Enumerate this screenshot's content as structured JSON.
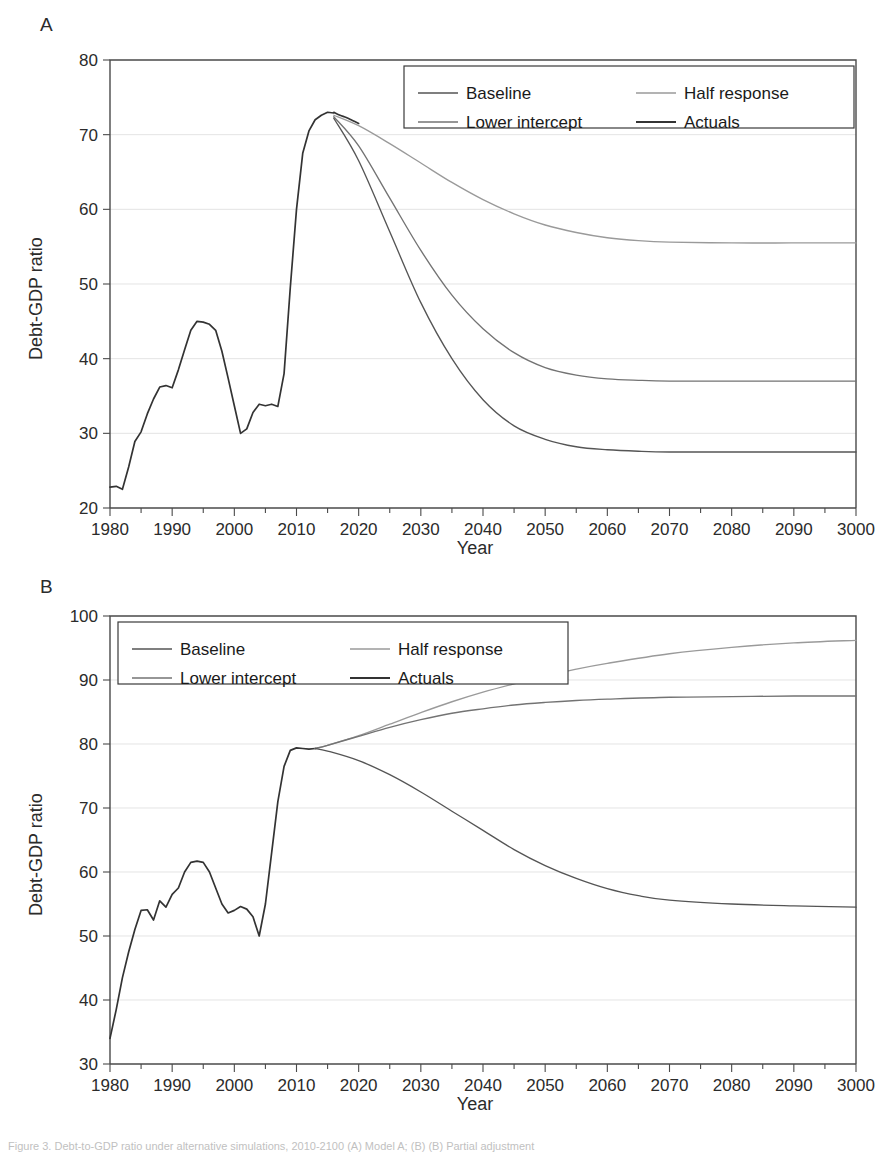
{
  "figure": {
    "caption": "Figure 3. Debt-to-GDP ratio under alternative simulations, 2010-2100 (A) Model A; (B) (B) Partial adjustment"
  },
  "panels": [
    {
      "letter": "A",
      "xlabel": "Year",
      "ylabel": "Debt-GDP ratio",
      "legend_position": "top-right"
    },
    {
      "letter": "B",
      "xlabel": "Year",
      "ylabel": "Debt-GDP ratio",
      "legend_position": "top-left"
    }
  ],
  "legend": {
    "entries": [
      "Baseline",
      "Half response",
      "Lower intercept",
      "Actuals"
    ]
  },
  "colors": {
    "baseline": "#555555",
    "half_response": "#9a9a9a",
    "lower_intercept": "#737373",
    "actuals": "#333333",
    "axis": "#4a4a4a",
    "grid": "#d8d8d8"
  },
  "chart_data": [
    {
      "type": "line",
      "panel": "A",
      "title": "",
      "xlabel": "Year",
      "ylabel": "Debt-GDP ratio",
      "xlim": [
        1980,
        2100
      ],
      "ylim": [
        20,
        80
      ],
      "yticks": [
        20,
        30,
        40,
        50,
        60,
        70,
        80
      ],
      "xticks": [
        1980,
        1990,
        2000,
        2010,
        2020,
        2030,
        2040,
        2050,
        2060,
        2070,
        2080,
        2090,
        3000
      ],
      "xtick_labels": [
        "1980",
        "1990",
        "2000",
        "2010",
        "2020",
        "2030",
        "2040",
        "2050",
        "2060",
        "2070",
        "2080",
        "2090",
        "3000"
      ],
      "minor_xtick_step": 5,
      "grid": "horizontal",
      "legend": [
        "Baseline",
        "Half response",
        "Lower intercept",
        "Actuals"
      ],
      "series": [
        {
          "name": "Historical",
          "color": "#333333",
          "x": [
            1980,
            1981,
            1982,
            1983,
            1984,
            1985,
            1986,
            1987,
            1988,
            1989,
            1990,
            1991,
            1992,
            1993,
            1994,
            1995,
            1996,
            1997,
            1998,
            1999,
            2000,
            2001,
            2002,
            2003,
            2004,
            2005,
            2006,
            2007,
            2008,
            2009,
            2010,
            2011,
            2012,
            2013,
            2014,
            2015,
            2016
          ],
          "values": [
            22.8,
            22.9,
            22.5,
            25.5,
            28.9,
            30.2,
            32.6,
            34.6,
            36.2,
            36.4,
            36.1,
            38.5,
            41.2,
            43.8,
            45.0,
            44.9,
            44.6,
            43.8,
            41.0,
            37.4,
            33.7,
            30.0,
            30.6,
            32.8,
            33.9,
            33.7,
            33.9,
            33.6,
            38.0,
            49.5,
            60.0,
            67.5,
            70.5,
            72.0,
            72.6,
            73.0,
            72.9
          ]
        },
        {
          "name": "Actuals",
          "color": "#333333",
          "x": [
            2016,
            2017,
            2018,
            2019,
            2020
          ],
          "values": [
            73.0,
            72.6,
            72.3,
            71.9,
            71.5
          ]
        },
        {
          "name": "Half response",
          "color": "#9a9a9a",
          "x": [
            2016,
            2020,
            2025,
            2030,
            2035,
            2040,
            2045,
            2050,
            2055,
            2060,
            2065,
            2070,
            2080,
            2090,
            2100
          ],
          "values": [
            72.6,
            71.2,
            68.8,
            66.2,
            63.6,
            61.3,
            59.4,
            57.9,
            56.9,
            56.2,
            55.8,
            55.6,
            55.5,
            55.5,
            55.5
          ]
        },
        {
          "name": "Lower intercept",
          "color": "#737373",
          "x": [
            2016,
            2020,
            2025,
            2030,
            2035,
            2040,
            2045,
            2050,
            2055,
            2060,
            2065,
            2070,
            2080,
            2090,
            2100
          ],
          "values": [
            72.4,
            68.5,
            61.5,
            54.5,
            48.5,
            44.0,
            40.8,
            38.8,
            37.8,
            37.3,
            37.1,
            37.0,
            37.0,
            37.0,
            37.0
          ]
        },
        {
          "name": "Baseline",
          "color": "#555555",
          "x": [
            2016,
            2020,
            2025,
            2030,
            2035,
            2040,
            2045,
            2050,
            2055,
            2060,
            2065,
            2070,
            2080,
            2090,
            2100
          ],
          "values": [
            72.2,
            66.5,
            57.0,
            47.5,
            40.0,
            34.5,
            31.0,
            29.2,
            28.2,
            27.8,
            27.6,
            27.5,
            27.5,
            27.5,
            27.5
          ]
        }
      ],
      "endpoints_2100": {
        "half_response": 55.5,
        "lower_intercept": 37.0,
        "baseline": 27.5
      },
      "peak": {
        "year": 2016,
        "value": 73.0
      }
    },
    {
      "type": "line",
      "panel": "B",
      "title": "",
      "xlabel": "Year",
      "ylabel": "Debt-GDP ratio",
      "xlim": [
        1980,
        2100
      ],
      "ylim": [
        30,
        100
      ],
      "yticks": [
        30,
        40,
        50,
        60,
        70,
        80,
        90,
        100
      ],
      "xticks": [
        1980,
        1990,
        2000,
        2010,
        2020,
        2030,
        2040,
        2050,
        2060,
        2070,
        2080,
        2090,
        3000
      ],
      "xtick_labels": [
        "1980",
        "1990",
        "2000",
        "2010",
        "2020",
        "2030",
        "2040",
        "2050",
        "2060",
        "2070",
        "2080",
        "2090",
        "3000"
      ],
      "minor_xtick_step": 5,
      "grid": "horizontal",
      "legend": [
        "Baseline",
        "Half response",
        "Lower intercept",
        "Actuals"
      ],
      "series": [
        {
          "name": "Historical",
          "color": "#333333",
          "x": [
            1980,
            1981,
            1982,
            1983,
            1984,
            1985,
            1986,
            1987,
            1988,
            1989,
            1990,
            1991,
            1992,
            1993,
            1994,
            1995,
            1996,
            1997,
            1998,
            1999,
            2000,
            2001,
            2002,
            2003,
            2004,
            2005,
            2006,
            2007,
            2008,
            2009,
            2010,
            2011,
            2012,
            2013
          ],
          "values": [
            34.0,
            38.5,
            43.5,
            47.5,
            51.0,
            54.0,
            54.1,
            52.5,
            55.5,
            54.5,
            56.5,
            57.5,
            60.0,
            61.5,
            61.7,
            61.5,
            60.0,
            57.5,
            55.0,
            53.6,
            54.0,
            54.6,
            54.2,
            53.0,
            50.0,
            55.0,
            63.0,
            71.0,
            76.5,
            79.0,
            79.4,
            79.3,
            79.2,
            79.3
          ]
        },
        {
          "name": "Half response",
          "color": "#9a9a9a",
          "x": [
            2013,
            2015,
            2020,
            2025,
            2030,
            2035,
            2040,
            2045,
            2050,
            2055,
            2060,
            2070,
            2080,
            2090,
            2100
          ],
          "values": [
            79.3,
            79.8,
            81.3,
            83.1,
            84.9,
            86.6,
            88.1,
            89.4,
            90.6,
            91.7,
            92.6,
            94.1,
            95.1,
            95.8,
            96.2
          ]
        },
        {
          "name": "Lower intercept",
          "color": "#737373",
          "x": [
            2013,
            2015,
            2020,
            2025,
            2030,
            2035,
            2040,
            2045,
            2050,
            2055,
            2060,
            2070,
            2080,
            2090,
            2100
          ],
          "values": [
            79.3,
            79.8,
            81.2,
            82.6,
            83.8,
            84.8,
            85.5,
            86.1,
            86.5,
            86.8,
            87.0,
            87.3,
            87.4,
            87.5,
            87.5
          ]
        },
        {
          "name": "Baseline",
          "color": "#555555",
          "x": [
            2013,
            2015,
            2020,
            2025,
            2030,
            2035,
            2040,
            2045,
            2050,
            2055,
            2060,
            2065,
            2070,
            2080,
            2090,
            2100
          ],
          "values": [
            79.3,
            78.9,
            77.4,
            75.2,
            72.5,
            69.5,
            66.5,
            63.5,
            61.0,
            59.0,
            57.4,
            56.3,
            55.6,
            55.0,
            54.7,
            54.5
          ]
        }
      ],
      "endpoints_2100": {
        "half_response": 96.2,
        "lower_intercept": 87.5,
        "baseline": 54.5
      },
      "peak": {
        "year": 2013,
        "value": 79.4
      }
    }
  ]
}
